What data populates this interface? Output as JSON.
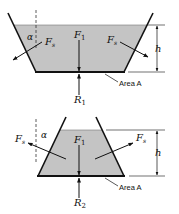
{
  "diagram": {
    "colors": {
      "fluid": "#c4c4c4",
      "line": "#111111",
      "background": "#ffffff"
    },
    "top": {
      "labels": {
        "angle": "α",
        "side_force_left": "F",
        "side_force_left_sub": "s",
        "weight": "F",
        "weight_sub": "1",
        "side_force_right": "F",
        "side_force_right_sub": "s",
        "height": "h",
        "reaction": "R",
        "reaction_sub": "1",
        "area": "Area A"
      }
    },
    "bottom": {
      "labels": {
        "angle": "α",
        "side_force_left": "F",
        "side_force_left_sub": "s",
        "weight": "F",
        "weight_sub": "1",
        "side_force_right": "F",
        "side_force_right_sub": "s",
        "height": "h",
        "reaction": "R",
        "reaction_sub": "2",
        "area": "Area A"
      }
    }
  }
}
